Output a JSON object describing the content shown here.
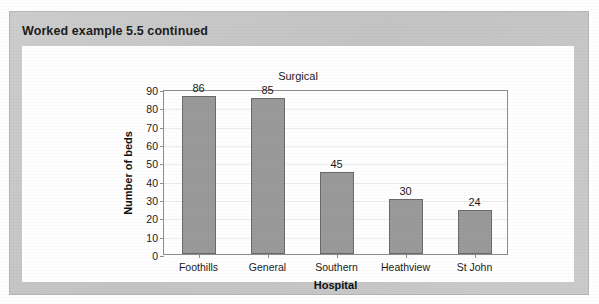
{
  "panel": {
    "header_title": "Worked example 5.5 continued",
    "panel_color": "#c9c9c9",
    "card_color": "#ffffff"
  },
  "chart_data": {
    "type": "bar",
    "title": "Surgical",
    "xlabel": "Hospital",
    "ylabel": "Number of beds",
    "categories": [
      "Foothills",
      "General",
      "Southern",
      "Heathview",
      "St John"
    ],
    "values": [
      86,
      85,
      45,
      30,
      24
    ],
    "data_labels": [
      "86",
      "85",
      "45",
      "30",
      "24"
    ],
    "ylim": [
      0,
      90
    ],
    "ytick_labels": [
      "0",
      "10",
      "20",
      "30",
      "40",
      "50",
      "60",
      "70",
      "80",
      "90"
    ],
    "ytick_values": [
      0,
      10,
      20,
      30,
      40,
      50,
      60,
      70,
      80,
      90
    ],
    "grid": true,
    "legend": "none",
    "bar_color": "#9a9a9a",
    "bar_border_color": "#6a6a6a",
    "axis_color": "#8d8d8d",
    "gridline_color": "#ededed"
  }
}
